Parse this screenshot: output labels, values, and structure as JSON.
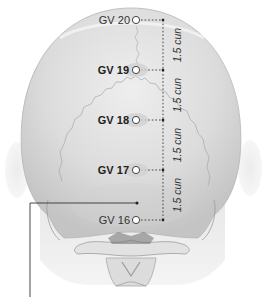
{
  "figure": {
    "colors": {
      "background": "#ffffff",
      "skull_fill": "#d9d9d9",
      "skull_highlight": "#ececec",
      "suture": "#a8a8a8",
      "text": "#333333",
      "marker_fill": "#ffffff",
      "marker_stroke": "#444444",
      "leader_line": "#333333"
    },
    "points": [
      {
        "id": "GV 20",
        "label": "GV 20",
        "bold": false,
        "x": 136,
        "y": 20
      },
      {
        "id": "GV 19",
        "label": "GV 19",
        "bold": true,
        "x": 136,
        "y": 70
      },
      {
        "id": "GV 18",
        "label": "GV 18",
        "bold": true,
        "x": 136,
        "y": 120
      },
      {
        "id": "GV 17",
        "label": "GV 17",
        "bold": true,
        "x": 136,
        "y": 170
      },
      {
        "id": "GV 16",
        "label": "GV 16",
        "bold": false,
        "x": 136,
        "y": 220
      }
    ],
    "measurements": [
      {
        "label": "1.5 cun",
        "from": "GV 20",
        "to": "GV 19"
      },
      {
        "label": "1.5 cun",
        "from": "GV 19",
        "to": "GV 18"
      },
      {
        "label": "1.5 cun",
        "from": "GV 18",
        "to": "GV 17"
      },
      {
        "label": "1.5 cun",
        "from": "GV 17",
        "to": "GV 16"
      }
    ]
  }
}
